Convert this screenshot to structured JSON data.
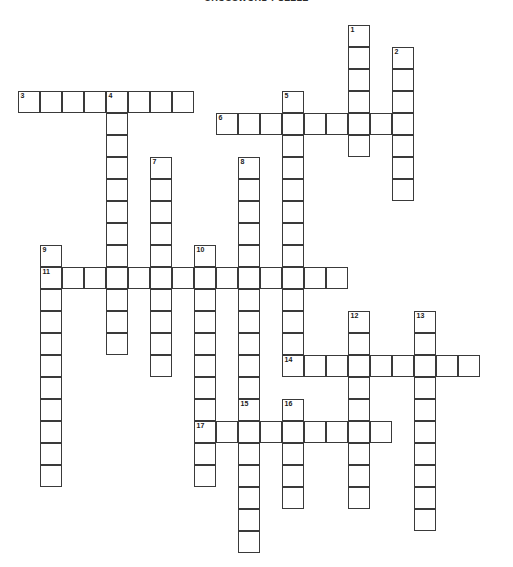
{
  "title": "CROSSWORD PUZZLE",
  "colors": {
    "cell_border": "#3a3a3a",
    "cell_fill": "#ffffff",
    "page_background": "#ffffff",
    "number_color": "#1a1a1a"
  },
  "grid": {
    "cell_size": 22,
    "origin_x": 18,
    "origin_y": 25,
    "columns": 23,
    "rows": 25
  },
  "entries": [
    {
      "number": 1,
      "direction": "down",
      "col": 15,
      "row": 0,
      "length": 6
    },
    {
      "number": 2,
      "direction": "down",
      "col": 17,
      "row": 1,
      "length": 7
    },
    {
      "number": 3,
      "direction": "across",
      "col": 0,
      "row": 3,
      "length": 8
    },
    {
      "number": 4,
      "direction": "down",
      "col": 4,
      "row": 3,
      "length": 12
    },
    {
      "number": 5,
      "direction": "down",
      "col": 12,
      "row": 3,
      "length": 12
    },
    {
      "number": 6,
      "direction": "across",
      "col": 9,
      "row": 4,
      "length": 8
    },
    {
      "number": 7,
      "direction": "down",
      "col": 6,
      "row": 6,
      "length": 10
    },
    {
      "number": 8,
      "direction": "down",
      "col": 10,
      "row": 6,
      "length": 13
    },
    {
      "number": 9,
      "direction": "down",
      "col": 1,
      "row": 10,
      "length": 11
    },
    {
      "number": 10,
      "direction": "down",
      "col": 8,
      "row": 10,
      "length": 11
    },
    {
      "number": 11,
      "direction": "across",
      "col": 1,
      "row": 11,
      "length": 14
    },
    {
      "number": 12,
      "direction": "down",
      "col": 15,
      "row": 13,
      "length": 9
    },
    {
      "number": 13,
      "direction": "down",
      "col": 18,
      "row": 13,
      "length": 10
    },
    {
      "number": 14,
      "direction": "across",
      "col": 12,
      "row": 15,
      "length": 9
    },
    {
      "number": 15,
      "direction": "down",
      "col": 10,
      "row": 17,
      "length": 7
    },
    {
      "number": 16,
      "direction": "down",
      "col": 12,
      "row": 17,
      "length": 5
    },
    {
      "number": 17,
      "direction": "across",
      "col": 8,
      "row": 18,
      "length": 9
    }
  ]
}
